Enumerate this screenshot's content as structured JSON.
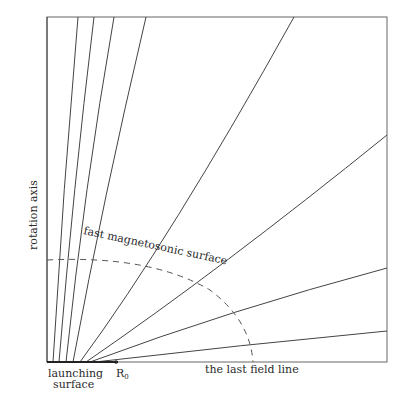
{
  "diagram": {
    "labels": {
      "rotation_axis": "rotation axis",
      "fast_surface": "fast magnetosonic surface",
      "launching_line1": "launching",
      "launching_line2": "surface",
      "r0": "R",
      "r0_sub": "0",
      "last_field_line": "the last field line"
    },
    "colors": {
      "line": "#444444",
      "frame": "#555555",
      "text": "#2a2a2a"
    }
  }
}
